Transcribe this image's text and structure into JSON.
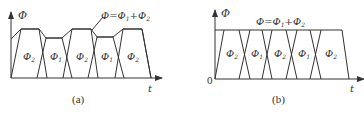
{
  "figure": {
    "panel_a": {
      "caption": "(a)",
      "y_axis_label": "Φ",
      "x_axis_label": "t",
      "sum_label_main": "Φ=Φ",
      "sum_label_sub1": "1",
      "sum_label_plus": "+Φ",
      "sum_label_sub2": "2",
      "regions": [
        {
          "main": "Φ",
          "sub": "2"
        },
        {
          "main": "Φ",
          "sub": "1"
        },
        {
          "main": "Φ",
          "sub": "2"
        },
        {
          "main": "Φ",
          "sub": "1"
        },
        {
          "main": "Φ",
          "sub": "2"
        }
      ]
    },
    "panel_b": {
      "caption": "(b)",
      "y_axis_label": "Φ",
      "x_axis_label": "t",
      "origin_label": "0",
      "sum_label_main": "Φ=Φ",
      "sum_label_sub1": "1",
      "sum_label_plus": "+Φ",
      "sum_label_sub2": "2",
      "regions": [
        {
          "main": "Φ",
          "sub": "2"
        },
        {
          "main": "Φ",
          "sub": "1"
        },
        {
          "main": "Φ",
          "sub": "2"
        },
        {
          "main": "Φ",
          "sub": "1"
        },
        {
          "main": "Φ",
          "sub": "2"
        }
      ]
    }
  }
}
